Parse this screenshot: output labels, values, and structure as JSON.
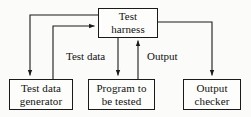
{
  "diagram": {
    "type": "flow-diagram",
    "style": {
      "background_color": "#fbfbf9",
      "line_color": "#1a1a1a",
      "text_color": "#111111",
      "box_fill": "#fdfdfb"
    },
    "nodes": [
      {
        "id": "test-harness",
        "lines": [
          "Test",
          "harness"
        ],
        "line1": "Test",
        "line2": "harness",
        "x": 98,
        "y": 8,
        "w": 60,
        "h": 30
      },
      {
        "id": "test-data-generator",
        "lines": [
          "Test data",
          "generator"
        ],
        "line1": "Test data",
        "line2": "generator",
        "x": 9,
        "y": 79,
        "w": 64,
        "h": 31
      },
      {
        "id": "program-under-test",
        "lines": [
          "Program to",
          "be tested"
        ],
        "line1": "Program to",
        "line2": "be tested",
        "x": 88,
        "y": 79,
        "w": 67,
        "h": 31
      },
      {
        "id": "output-checker",
        "lines": [
          "Output",
          "checker"
        ],
        "line1": "Output",
        "line2": "checker",
        "x": 183,
        "y": 79,
        "w": 58,
        "h": 31
      }
    ],
    "edge_labels": [
      {
        "id": "test-data",
        "text": "Test data",
        "x": 65,
        "y": 50
      },
      {
        "id": "output",
        "text": "Output",
        "x": 146,
        "y": 50
      }
    ],
    "edges": [
      {
        "id": "harness-to-generator",
        "from": "test-harness",
        "to": "test-data-generator",
        "label": "",
        "arrowhead": "end"
      },
      {
        "id": "generator-to-harness",
        "from": "test-data-generator",
        "to": "test-harness",
        "label": "",
        "arrowhead": "end"
      },
      {
        "id": "harness-to-program",
        "from": "test-harness",
        "to": "program-under-test",
        "label": "Test data",
        "arrowhead": "end"
      },
      {
        "id": "program-to-harness",
        "from": "program-under-test",
        "to": "test-harness",
        "label": "Output",
        "arrowhead": "end"
      },
      {
        "id": "harness-to-checker",
        "from": "test-harness",
        "to": "output-checker",
        "label": "",
        "arrowhead": "end"
      }
    ]
  }
}
